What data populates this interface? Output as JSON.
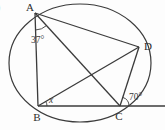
{
  "figure": {
    "type": "circle-geometry-diagram",
    "corner_fragment": ")",
    "points": {
      "a": "A",
      "b": "B",
      "c": "C",
      "d": "D"
    },
    "angles": {
      "at_a": "37°",
      "at_b": "x",
      "at_c": "70°"
    }
  },
  "colors": {
    "line": "#3b3b3b",
    "text": "#2e2e2e",
    "background": "#fdfdfd"
  }
}
